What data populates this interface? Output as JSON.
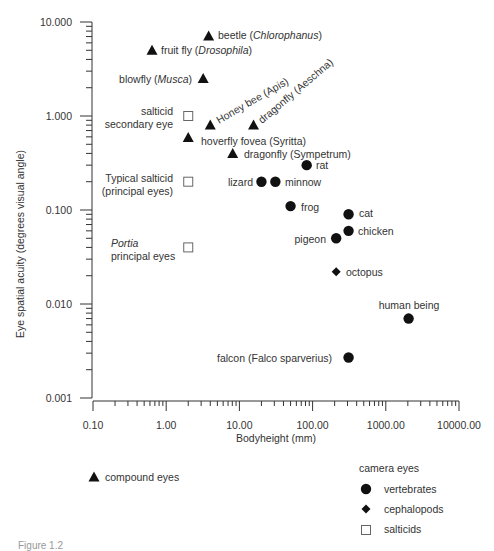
{
  "chart_data": {
    "type": "scatter",
    "title": "",
    "xlabel": "Bodyheight (mm)",
    "ylabel": "Eye spatial acuity (degrees visual angle)",
    "xscale": "log",
    "yscale": "log",
    "xlim": [
      0.1,
      10000
    ],
    "ylim": [
      0.001,
      10
    ],
    "x_ticks": [
      "0.10",
      "1.00",
      "10.00",
      "100.00",
      "1000.00",
      "10000.00"
    ],
    "y_ticks": [
      "10.000",
      "1.000",
      "0.100",
      "0.010",
      "0.001"
    ],
    "grid": false,
    "series": [
      {
        "name": "compound eyes",
        "marker": "triangle",
        "points": [
          {
            "label": "beetle (Chlorophanus)",
            "x": 3.8,
            "y": 7.1
          },
          {
            "label": "fruit fly (Drosophila)",
            "x": 0.64,
            "y": 5.0
          },
          {
            "label": "blowfly (Musca)",
            "x": 3.2,
            "y": 2.5
          },
          {
            "label": "Honey bee (Apis)",
            "x": 4.0,
            "y": 0.8
          },
          {
            "label": "dragonfly (Aeschna)",
            "x": 15.6,
            "y": 0.8
          },
          {
            "label": "hoverfly fovea (Syritta)",
            "x": 2.0,
            "y": 0.59
          },
          {
            "label": "dragonfly (Sympetrum)",
            "x": 8.1,
            "y": 0.4
          }
        ]
      },
      {
        "name": "vertebrates",
        "group": "camera eyes",
        "marker": "circle",
        "points": [
          {
            "label": "rat",
            "x": 83,
            "y": 0.3
          },
          {
            "label": "lizard",
            "x": 20,
            "y": 0.2
          },
          {
            "label": "minnow",
            "x": 31,
            "y": 0.2
          },
          {
            "label": "frog",
            "x": 50,
            "y": 0.11
          },
          {
            "label": "cat",
            "x": 310,
            "y": 0.09
          },
          {
            "label": "chicken",
            "x": 310,
            "y": 0.06
          },
          {
            "label": "pigeon",
            "x": 210,
            "y": 0.05
          },
          {
            "label": "human being",
            "x": 2050,
            "y": 0.007
          },
          {
            "label": "falcon (Falco sparverius)",
            "x": 310,
            "y": 0.0027
          }
        ]
      },
      {
        "name": "cephalopods",
        "group": "camera eyes",
        "marker": "diamond",
        "points": [
          {
            "label": "octopus",
            "x": 210,
            "y": 0.022
          }
        ]
      },
      {
        "name": "salticids",
        "group": "camera eyes",
        "marker": "open-square",
        "points": [
          {
            "label": "salticid secondary eye",
            "x": 2.0,
            "y": 1.0
          },
          {
            "label": "Typical salticid (principal eyes)",
            "x": 2.0,
            "y": 0.2
          },
          {
            "label": "Portia principal eyes",
            "x": 2.0,
            "y": 0.04
          }
        ]
      }
    ],
    "legend": {
      "left": [
        {
          "marker": "triangle",
          "label": "compound eyes"
        }
      ],
      "right_title": "camera eyes",
      "right": [
        {
          "marker": "circle",
          "label": "vertebrates"
        },
        {
          "marker": "diamond",
          "label": "cephalopods"
        },
        {
          "marker": "open-square",
          "label": "salticids"
        }
      ]
    }
  },
  "annotations": [
    {
      "id": "beetle",
      "parts": [
        [
          "beetle (",
          false
        ],
        [
          "Chlorophanus",
          true
        ],
        [
          ")",
          false
        ]
      ],
      "tx": 218,
      "ty": 39,
      "anchor": "start"
    },
    {
      "id": "fruitfly",
      "parts": [
        [
          "fruit fly (",
          false
        ],
        [
          "Drosophila",
          true
        ],
        [
          ")",
          false
        ]
      ],
      "tx": 161,
      "ty": 54,
      "anchor": "start"
    },
    {
      "id": "blowfly",
      "parts": [
        [
          "blowfly (",
          false
        ],
        [
          "Musca",
          true
        ],
        [
          ")",
          false
        ]
      ],
      "tx": 192,
      "ty": 83,
      "anchor": "end"
    },
    {
      "id": "salticid-secondary",
      "lines": [
        "salticid",
        "secondary eye"
      ],
      "tx": 173,
      "ty": 115,
      "anchor": "end",
      "lh": 13
    },
    {
      "id": "honeybee",
      "text": "Honey bee (Apis)",
      "tx": 219,
      "ty": 124,
      "anchor": "start",
      "rotate": -30
    },
    {
      "id": "aeschna",
      "text": "dragonfly (Aeschna)",
      "tx": 262,
      "ty": 124,
      "anchor": "start",
      "rotate": -40
    },
    {
      "id": "hoverfly",
      "text": "hoverfly fovea (Syritta)",
      "tx": 201,
      "ty": 145,
      "anchor": "start"
    },
    {
      "id": "sympetrum",
      "text": "dragonfly (Sympetrum)",
      "tx": 244,
      "ty": 158,
      "anchor": "start"
    },
    {
      "id": "rat",
      "text": "rat",
      "tx": 316,
      "ty": 169,
      "anchor": "start"
    },
    {
      "id": "lizard",
      "text": "lizard",
      "tx": 253,
      "ty": 186,
      "anchor": "end"
    },
    {
      "id": "minnow",
      "text": "minnow",
      "tx": 285,
      "ty": 186,
      "anchor": "start"
    },
    {
      "id": "typical-salticid",
      "lines": [
        "Typical salticid",
        "(principal eyes)"
      ],
      "tx": 173,
      "ty": 182,
      "anchor": "end",
      "lh": 13
    },
    {
      "id": "frog",
      "text": "frog",
      "tx": 301,
      "ty": 211,
      "anchor": "start"
    },
    {
      "id": "cat",
      "text": "cat",
      "tx": 359,
      "ty": 217,
      "anchor": "start"
    },
    {
      "id": "chicken",
      "text": "chicken",
      "tx": 358,
      "ty": 235,
      "anchor": "start"
    },
    {
      "id": "pigeon",
      "text": "pigeon",
      "tx": 326,
      "ty": 243,
      "anchor": "end"
    },
    {
      "id": "portia",
      "lines_parts": [
        [
          [
            "Portia",
            true
          ]
        ],
        [
          [
            "principal eyes",
            false
          ]
        ]
      ],
      "tx": 111,
      "ty": 247,
      "anchor": "start",
      "lh": 13
    },
    {
      "id": "octopus",
      "text": "octopus",
      "tx": 346,
      "ty": 276,
      "anchor": "start"
    },
    {
      "id": "human",
      "text": "human being",
      "tx": 409,
      "ty": 309,
      "anchor": "middle"
    },
    {
      "id": "falcon",
      "text": "falcon (Falco sparverius)",
      "tx": 332,
      "ty": 362,
      "anchor": "end"
    }
  ],
  "caption": "Figure 1.2"
}
